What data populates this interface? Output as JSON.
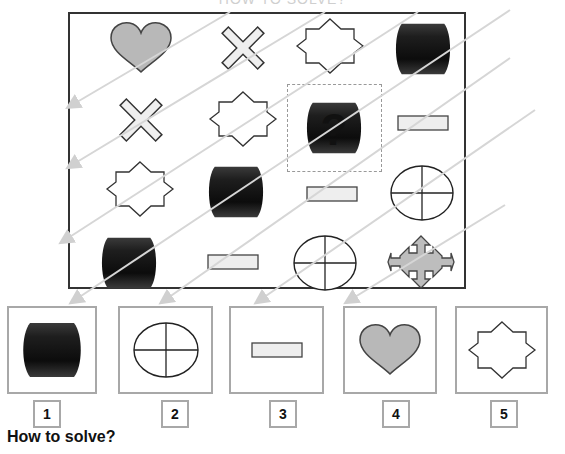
{
  "puzzle": {
    "title": "HOW TO SOLVE?",
    "grid": [
      [
        "heart-gray",
        "cross-light",
        "star8-outline",
        "barrel-dark"
      ],
      [
        "cross-light",
        "star8-outline",
        "question",
        "rect-light"
      ],
      [
        "star8-outline",
        "barrel-dark",
        "rect-light",
        "circle-quartered"
      ],
      [
        "barrel-dark",
        "rect-light",
        "circle-quartered",
        "arrows4-gray"
      ]
    ],
    "missing_cell": {
      "row": 2,
      "col": 3
    }
  },
  "answers": [
    {
      "number": "1",
      "shape": "barrel-dark"
    },
    {
      "number": "2",
      "shape": "circle-quartered"
    },
    {
      "number": "3",
      "shape": "rect-light"
    },
    {
      "number": "4",
      "shape": "heart-gray"
    },
    {
      "number": "5",
      "shape": "star8-outline"
    }
  ],
  "footer": {
    "how_to_solve": "How to solve?"
  },
  "colors": {
    "frame": "#333333",
    "heart_fill": "#b8b8b8",
    "barrel_fill": "#1a1a1a",
    "rect_fill": "#eeeeee",
    "arrows_fill": "#bdbdbd",
    "diagonal_lines": "#d6d6d6",
    "answer_border": "#a8a8a8"
  }
}
